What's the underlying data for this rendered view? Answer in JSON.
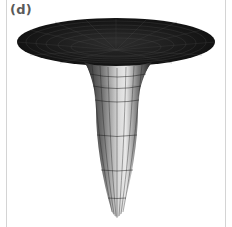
{
  "figure": {
    "panel_label": "(d)",
    "colors": {
      "rim_top": "#1a1a1a",
      "mesh_lines": "#000000",
      "highlight": "#e6e6e6",
      "frame": "#d4d4d4",
      "background": "#ffffff"
    }
  }
}
